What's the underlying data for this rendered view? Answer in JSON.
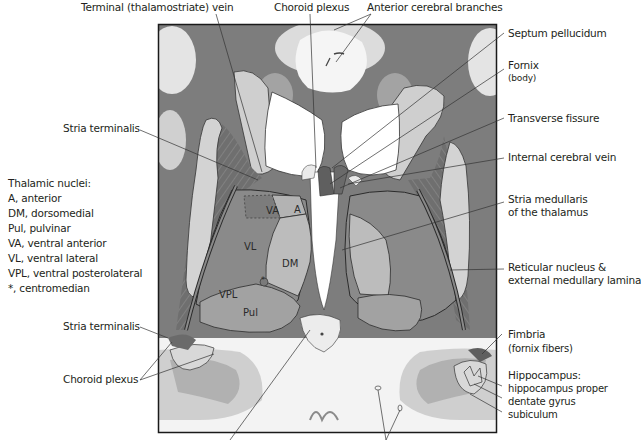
{
  "figure": {
    "type": "coronal section of brain through thalamus",
    "colors": {
      "gray_matter": "#8a8a8a",
      "dark_gray": "#6e6e6e",
      "white_matter": "#d9d9d9",
      "ventricle": "#ffffff",
      "outline": "#2b2b2b",
      "frame": "#1a1a1a"
    }
  },
  "labels_top": {
    "terminal_vein": "Terminal (thalamostriate) vein",
    "choroid_plexus": "Choroid plexus",
    "anterior_cerebral": "Anterior cerebral branches"
  },
  "labels_right": {
    "septum": "Septum pellucidum",
    "fornix": "Fornix",
    "fornix_sub": "(body)",
    "transverse": "Transverse fissure",
    "internal_vein": "Internal cerebral vein",
    "stria_medullaris_1": "Stria medullaris",
    "stria_medullaris_2": "of the thalamus",
    "reticular_1": "Reticular nucleus &",
    "reticular_2": "external medullary lamina",
    "fimbria": "Fimbria",
    "fimbria_sub": "(fornix fibers)",
    "hippocampus": "Hippocampus:",
    "hippocampus_proper": "hippocampus proper",
    "dentate": "dentate gyrus",
    "subiculum": "subiculum"
  },
  "labels_left": {
    "stria_terminalis_top": "Stria terminalis",
    "stria_terminalis_bottom": "Stria terminalis",
    "choroid_plexus_bottom": "Choroid plexus"
  },
  "legend": {
    "title": "Thalamic nuclei:",
    "items": [
      "A, anterior",
      "DM, dorsomedial",
      "Pul, pulvinar",
      "VA, ventral anterior",
      "VL, ventral lateral",
      "VPL, ventral posterolateral",
      "*, centromedian"
    ]
  },
  "nuclei_labels": {
    "va": "VA",
    "a": "A",
    "vl": "VL",
    "dm": "DM",
    "vpl": "VPL",
    "pul": "Pul",
    "cm": "*"
  }
}
